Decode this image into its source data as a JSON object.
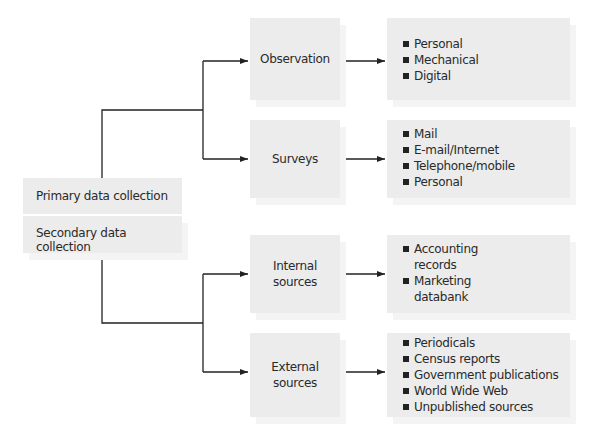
{
  "root": {
    "primary_label": "Primary data collection",
    "secondary_label": "Secondary data collection"
  },
  "primary_branches": [
    {
      "label": "Observation",
      "items": [
        "Personal",
        "Mechanical",
        "Digital"
      ]
    },
    {
      "label": "Surveys",
      "items": [
        "Mail",
        "E-mail/Internet",
        "Telephone/mobile",
        "Personal"
      ]
    }
  ],
  "secondary_branches": [
    {
      "label": "Internal sources",
      "label_lines": [
        "Internal",
        "sources"
      ],
      "items": [
        "Accounting records",
        "Marketing databank"
      ],
      "item_lines": [
        [
          "Accounting",
          "records"
        ],
        [
          "Marketing",
          "databank"
        ]
      ]
    },
    {
      "label": "External sources",
      "label_lines": [
        "External",
        "sources"
      ],
      "items": [
        "Periodicals",
        "Census reports",
        "Government publications",
        "World Wide Web",
        "Unpublished sources"
      ]
    }
  ],
  "colors": {
    "box_fill": "#ececec",
    "line": "#222222"
  }
}
